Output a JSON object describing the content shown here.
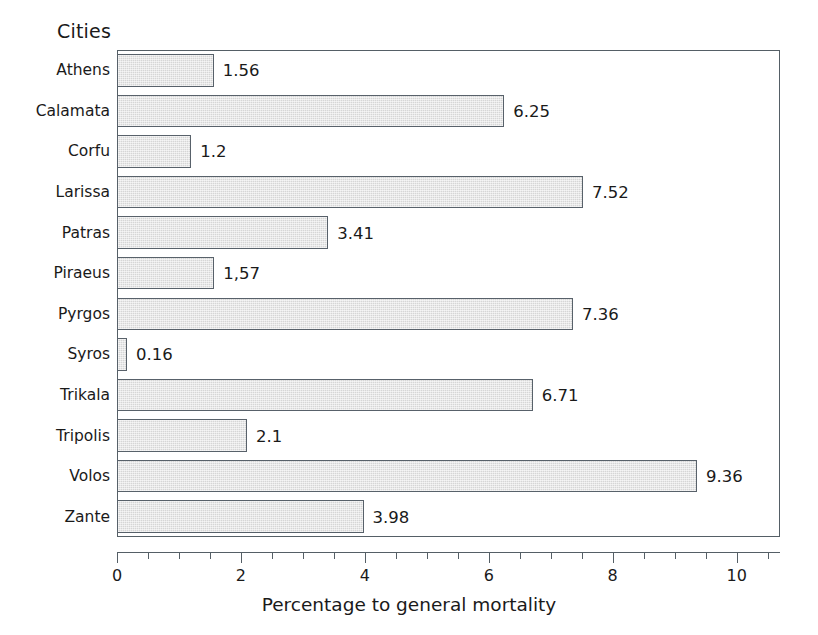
{
  "chart_data": {
    "type": "bar",
    "orientation": "horizontal",
    "title": "",
    "ylabel": "Cities",
    "xlabel": "Percentage to general mortality",
    "categories": [
      "Athens",
      "Calamata",
      "Corfu",
      "Larissa",
      "Patras",
      "Piraeus",
      "Pyrgos",
      "Syros",
      "Trikala",
      "Tripolis",
      "Volos",
      "Zante"
    ],
    "values": [
      1.56,
      6.25,
      1.2,
      7.52,
      3.41,
      1.57,
      7.36,
      0.16,
      6.71,
      2.1,
      9.36,
      3.98
    ],
    "value_labels": [
      "1.56",
      "6.25",
      "1.2",
      "7.52",
      "3.41",
      "1,57",
      "7.36",
      "0.16",
      "6.71",
      "2.1",
      "9.36",
      "3.98"
    ],
    "xlim": [
      0,
      10.7
    ],
    "xticks": [
      0,
      2,
      4,
      6,
      8,
      10
    ],
    "xtick_labels": [
      "0",
      "2",
      "4",
      "6",
      "8",
      "10"
    ],
    "xtick_minor_step": 0.5,
    "grid": false,
    "legend": false,
    "bar_fill_color": "#d6d6d6",
    "bar_edge_color": "#58616a",
    "axis_color": "#555f66",
    "text_color": "#1a1a1a",
    "background_color": "#ffffff"
  }
}
